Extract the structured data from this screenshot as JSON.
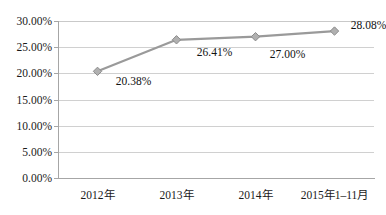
{
  "chart_data": {
    "type": "line",
    "title": "",
    "subtitle": "",
    "xlabel": "",
    "ylabel": "",
    "categories": [
      "2012年",
      "2013年",
      "2014年",
      "2015年1–11月"
    ],
    "values": [
      20.38,
      26.41,
      27.0,
      28.08
    ],
    "point_labels": [
      "20.38%",
      "26.41%",
      "27.00%",
      "28.08%"
    ],
    "series": [
      {
        "name": "",
        "values": [
          20.38,
          26.41,
          27.0,
          28.08
        ],
        "color": "#9a9a9a",
        "marker": "diamond",
        "marker_color": "#b0b0b0",
        "marker_edge_color": "#8c8c8c"
      }
    ],
    "ylim": [
      0,
      30
    ],
    "ytick_values": [
      0,
      5,
      10,
      15,
      20,
      25,
      30
    ],
    "ytick_labels": [
      "0.00%",
      "5.00%",
      "10.00%",
      "15.00%",
      "20.00%",
      "25.00%",
      "30.00%"
    ],
    "grid": "horizontal",
    "legend": "none",
    "axis_color": "#a6a6a6",
    "gridline_color": "#d0d0d0",
    "background_color": "#ffffff",
    "text_color": "#1a1a1a"
  }
}
